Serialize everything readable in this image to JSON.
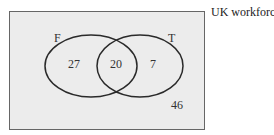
{
  "universe": {
    "label": "UK workforce",
    "fill": "#ececec",
    "stroke": "#555555"
  },
  "sets": [
    {
      "name": "F",
      "only_count": "27"
    },
    {
      "name": "T",
      "only_count": "7"
    }
  ],
  "intersection": {
    "count": "20"
  },
  "outside": {
    "count": "46"
  },
  "circle_stroke": "#2a2a2a"
}
